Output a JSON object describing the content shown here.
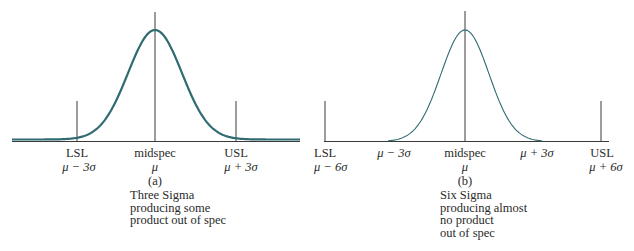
{
  "panels": [
    {
      "id": "a",
      "caption": "(a)",
      "description": [
        "Three Sigma",
        "producing some",
        "product out of spec"
      ],
      "markers": [
        {
          "name": "lsl",
          "label": "LSL",
          "value": "μ − 3σ"
        },
        {
          "name": "midspec",
          "label": "midspec",
          "value": "μ"
        },
        {
          "name": "usl",
          "label": "USL",
          "value": "μ + 3σ"
        }
      ],
      "sigma_multiple_spec_limits": 3
    },
    {
      "id": "b",
      "caption": "(b)",
      "description": [
        "Six Sigma",
        "producing almost",
        "no product",
        "out of spec"
      ],
      "markers": [
        {
          "name": "lsl",
          "label": "LSL",
          "value": "μ − 6σ"
        },
        {
          "name": "minus-3-sigma",
          "label": "",
          "value": "μ − 3σ"
        },
        {
          "name": "midspec",
          "label": "midspec",
          "value": "μ"
        },
        {
          "name": "plus-3-sigma",
          "label": "",
          "value": "μ + 3σ"
        },
        {
          "name": "usl",
          "label": "USL",
          "value": "μ + 6σ"
        }
      ],
      "sigma_multiple_spec_limits": 6
    }
  ],
  "colors": {
    "curve": "#2f6b70",
    "lines": "#3a3a3a",
    "text": "#2a2a2a"
  }
}
